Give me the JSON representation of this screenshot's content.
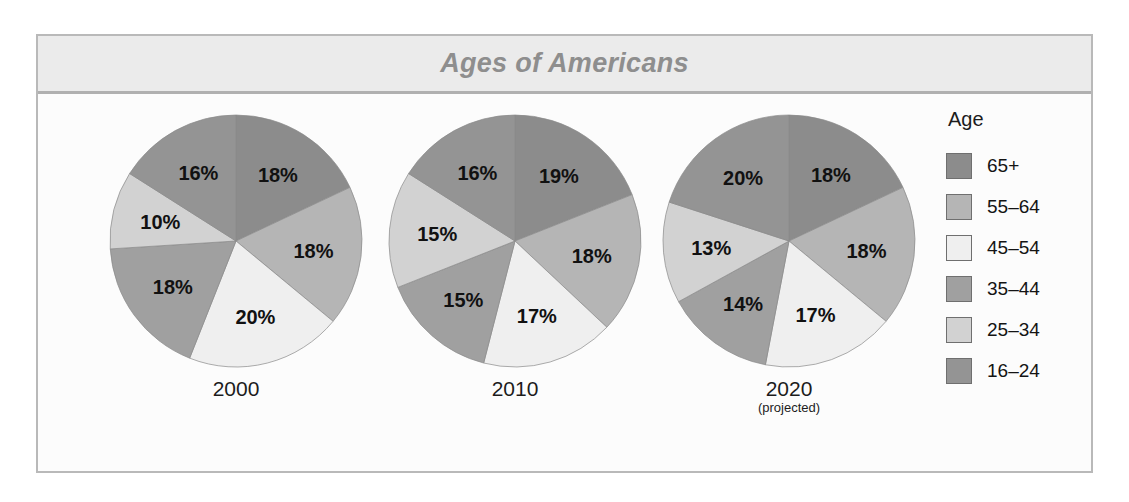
{
  "figure": {
    "title": "Ages of Americans"
  },
  "legend": {
    "title": "Age",
    "entries": [
      {
        "label": "65+",
        "color": "#8c8c8c"
      },
      {
        "label": "55–64",
        "color": "#b5b5b5"
      },
      {
        "label": "45–54",
        "color": "#efefef"
      },
      {
        "label": "35–44",
        "color": "#a0a0a0"
      },
      {
        "label": "25–34",
        "color": "#d2d2d2"
      },
      {
        "label": "16–24",
        "color": "#949494"
      }
    ]
  },
  "chart_data": {
    "type": "pie",
    "title": "Ages of Americans",
    "legend_title": "Age",
    "legend_position": "right",
    "unit": "percent",
    "categories": [
      "65+",
      "55–64",
      "45–54",
      "35–44",
      "25–34",
      "16–24"
    ],
    "colors": [
      "#8c8c8c",
      "#b5b5b5",
      "#efefef",
      "#a0a0a0",
      "#d2d2d2",
      "#949494"
    ],
    "slice_order": "clockwise from 12 o'clock",
    "charts": [
      {
        "name": "2000",
        "caption": "2000",
        "caption_sub": "",
        "values": [
          18,
          18,
          20,
          18,
          10,
          16
        ],
        "labels": [
          "18%",
          "18%",
          "20%",
          "18%",
          "10%",
          "16%"
        ]
      },
      {
        "name": "2010",
        "caption": "2010",
        "caption_sub": "",
        "values": [
          19,
          18,
          17,
          15,
          15,
          16
        ],
        "labels": [
          "19%",
          "18%",
          "17%",
          "15%",
          "15%",
          "16%"
        ]
      },
      {
        "name": "2020",
        "caption": "2020",
        "caption_sub": "(projected)",
        "values": [
          18,
          18,
          17,
          14,
          13,
          20
        ],
        "labels": [
          "18%",
          "18%",
          "17%",
          "14%",
          "13%",
          "20%"
        ]
      }
    ]
  }
}
